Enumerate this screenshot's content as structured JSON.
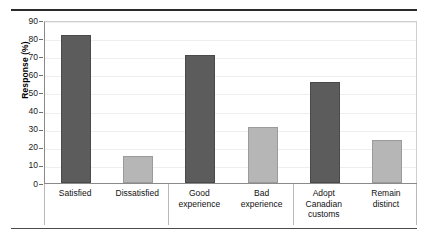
{
  "chart_data": {
    "type": "bar",
    "title": "",
    "subtitle": "",
    "xlabel": "",
    "ylabel": "Response (%)",
    "ylim": [
      0,
      90
    ],
    "ytick_step": 10,
    "yticks": [
      0,
      10,
      20,
      30,
      40,
      50,
      60,
      70,
      80,
      90
    ],
    "ytick_labels": [
      "0",
      "10",
      "20",
      "30",
      "40",
      "50",
      "60",
      "70",
      "80",
      "90"
    ],
    "grid": "horizontal",
    "legend_position": "none",
    "categories": [
      "Satisfied",
      "Dissatisfied",
      "Good experience",
      "Bad experience",
      "Adopt Canadian customs",
      "Remain distinct"
    ],
    "category_lines": [
      [
        "Satisfied"
      ],
      [
        "Dissatisfied"
      ],
      [
        "Good",
        "experience"
      ],
      [
        "Bad",
        "experience"
      ],
      [
        "Adopt",
        "Canadian",
        "customs"
      ],
      [
        "Remain",
        "distinct"
      ]
    ],
    "values": [
      81.5,
      15,
      70.5,
      31,
      55.5,
      24
    ],
    "bar_shades": [
      "dark",
      "light",
      "dark",
      "light",
      "dark",
      "light"
    ],
    "groups": [
      {
        "label": "",
        "categories": [
          "Satisfied",
          "Dissatisfied"
        ]
      },
      {
        "label": "",
        "categories": [
          "Good experience",
          "Bad experience"
        ]
      },
      {
        "label": "",
        "categories": [
          "Adopt Canadian customs",
          "Remain distinct"
        ]
      }
    ],
    "annotations": []
  },
  "colors": {
    "bar_dark": "#5c5c5c",
    "bar_light": "#b6b6b6",
    "gridline": "#eeeeee",
    "axis": "#8a8a8a",
    "rule": "#2b2b2b",
    "text": "#111111",
    "background": "#ffffff"
  }
}
